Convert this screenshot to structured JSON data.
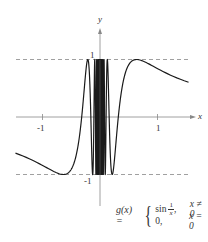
{
  "chart_data": {
    "type": "line",
    "title": "",
    "function": "g(x) = sin(1/x) for x != 0; 0 for x = 0",
    "xlabel": "x",
    "ylabel": "y",
    "x_range": [
      -1.47,
      1.54
    ],
    "ylim": [
      -1,
      1
    ],
    "x_ticks": [
      -1,
      1
    ],
    "x_tick_labels": [
      "-1",
      "1"
    ],
    "y_tick_labels": [
      "1",
      "-1"
    ],
    "y_ticks": [
      1,
      -1
    ],
    "reference_lines": [
      {
        "y": 1,
        "style": "dashed"
      },
      {
        "y": -1,
        "style": "dashed"
      }
    ],
    "grid": false,
    "legend": null,
    "annotation": {
      "lhs": "g(x) =",
      "case1_expr": "sin",
      "case1_num": "1",
      "case1_den": "x",
      "case1_cond": "x ≠ 0",
      "case2_expr": "0,",
      "case2_cond": "x = 0"
    },
    "layout": {
      "origin_px": [
        100,
        117
      ],
      "unit_px_x": 57.5,
      "unit_px_y": 57.5,
      "x_axis_px": [
        16,
        196
      ],
      "y_axis_px": [
        28,
        206
      ],
      "dash_px": [
        16,
        190
      ]
    },
    "colors": {
      "curve": "#1a1a1a",
      "axis": "#888888",
      "dash": "#888888",
      "text": "#333333"
    }
  }
}
